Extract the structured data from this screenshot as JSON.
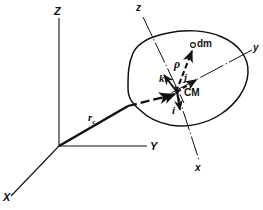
{
  "figure": {
    "background_color": "#ffffff",
    "stroke_color": "#111111",
    "axes_inertial": {
      "origin_label": "",
      "x_label": "X",
      "y_label": "Y",
      "z_label": "Z"
    },
    "axes_body": {
      "x_label": "x",
      "y_label": "y",
      "z_label": "z"
    },
    "points": {
      "center_of_mass_label": "CM",
      "mass_element_label": "dm"
    },
    "vectors": {
      "position_cm_label": "r",
      "position_cm_subscript": "c",
      "rho_label": "ρ",
      "unit_i_label": "i",
      "unit_j_label": "j",
      "unit_k_label": "k"
    }
  },
  "geometry": {
    "inertial_origin": [
      59,
      146
    ],
    "inertial_z_tip": [
      59,
      18
    ],
    "inertial_y_tip": [
      147,
      146
    ],
    "inertial_x_tip": [
      11,
      196
    ],
    "cm_point": [
      177,
      93
    ],
    "dm_point": [
      193,
      45
    ],
    "body_z_tip": [
      143,
      17
    ],
    "body_y_tip": [
      252,
      50
    ],
    "body_x_tip": [
      199,
      160
    ]
  }
}
